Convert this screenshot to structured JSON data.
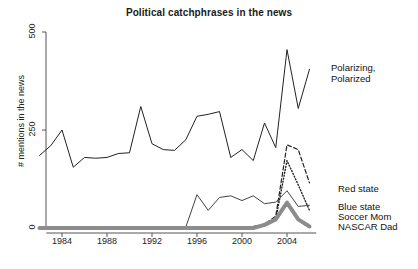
{
  "chart_data": {
    "type": "line",
    "title": "Political catchphrases in the news",
    "xlabel": "",
    "ylabel": "# mentions in the news",
    "xlim": [
      1982,
      2007
    ],
    "ylim": [
      0,
      500
    ],
    "grid": false,
    "legend_position": "right-inline",
    "xticks": [
      1984,
      1988,
      1992,
      1996,
      2000,
      2004
    ],
    "yticks": [
      0,
      250,
      500
    ],
    "x": [
      1982,
      1983,
      1984,
      1985,
      1986,
      1987,
      1988,
      1989,
      1990,
      1991,
      1992,
      1993,
      1994,
      1995,
      1996,
      1997,
      1998,
      1999,
      2000,
      2001,
      2002,
      2003,
      2004,
      2005,
      2006
    ],
    "series": [
      {
        "name": "Polarizing, Polarized",
        "style": "solid",
        "color": "#222222",
        "width": 1,
        "values": [
          185,
          210,
          250,
          155,
          180,
          178,
          180,
          190,
          192,
          310,
          215,
          200,
          198,
          225,
          285,
          290,
          297,
          180,
          200,
          172,
          268,
          205,
          455,
          305,
          405
        ]
      },
      {
        "name": "Red state",
        "style": "dashed",
        "color": "#222222",
        "width": 1.2,
        "values": [
          0,
          0,
          0,
          0,
          0,
          0,
          0,
          0,
          0,
          0,
          0,
          0,
          0,
          0,
          0,
          0,
          0,
          0,
          0,
          4,
          10,
          30,
          212,
          200,
          115
        ]
      },
      {
        "name": "Blue state",
        "style": "dotted",
        "color": "#222222",
        "width": 1.4,
        "values": [
          0,
          0,
          0,
          0,
          0,
          0,
          0,
          0,
          0,
          0,
          0,
          0,
          0,
          0,
          0,
          0,
          0,
          0,
          0,
          2,
          6,
          22,
          172,
          110,
          45
        ]
      },
      {
        "name": "Soccer Mom",
        "style": "solid",
        "color": "#444444",
        "width": 1,
        "values": [
          0,
          0,
          0,
          0,
          0,
          0,
          0,
          0,
          0,
          0,
          0,
          0,
          0,
          2,
          85,
          45,
          78,
          82,
          70,
          82,
          62,
          66,
          95,
          55,
          58
        ]
      },
      {
        "name": "NASCAR Dad",
        "style": "thick-gray",
        "color": "#8c8c8c",
        "width": 4,
        "values": [
          0,
          0,
          0,
          0,
          0,
          0,
          0,
          0,
          0,
          0,
          0,
          0,
          0,
          0,
          0,
          0,
          0,
          0,
          0,
          0,
          8,
          22,
          65,
          22,
          4
        ]
      }
    ],
    "annotations": [
      {
        "name": "polarizing-label",
        "text_line1": "Polarizing,",
        "text_line2": "Polarized",
        "x": 331,
        "y": 62
      },
      {
        "name": "red-state-label",
        "text": "Red state",
        "x": 338,
        "y": 183
      },
      {
        "name": "blue-state-label",
        "text": "Blue state",
        "x": 338,
        "y": 201
      },
      {
        "name": "soccer-mom-label",
        "text": "Soccer Mom",
        "x": 338,
        "y": 211
      },
      {
        "name": "nascar-dad-label",
        "text": "NASCAR Dad",
        "x": 338,
        "y": 221
      }
    ]
  },
  "axes": {
    "ytick_labels": [
      "0",
      "250",
      "500"
    ],
    "xtick_labels": [
      "1984",
      "1988",
      "1992",
      "1996",
      "2000",
      "2004"
    ]
  },
  "labels": {
    "title": "Political catchphrases in the news",
    "ylabel": "# mentions in the news",
    "polarizing_line1": "Polarizing,",
    "polarizing_line2": "Polarized",
    "red_state": "Red state",
    "blue_state": "Blue state",
    "soccer_mom": "Soccer Mom",
    "nascar_dad": "NASCAR Dad"
  },
  "colors": {
    "axis": "#555555",
    "line": "#222222",
    "nascar": "#8c8c8c",
    "background": "#ffffff"
  }
}
